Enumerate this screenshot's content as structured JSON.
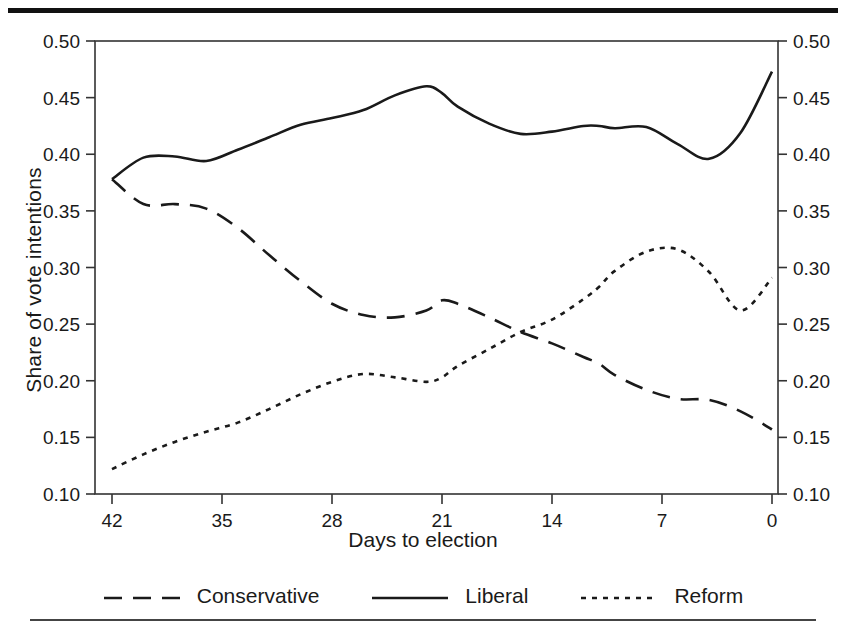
{
  "figure": {
    "ylabel": "Share of vote intentions",
    "xlabel": "Days to election",
    "y_ticks": [
      "0.50",
      "0.45",
      "0.40",
      "0.35",
      "0.30",
      "0.25",
      "0.20",
      "0.15",
      "0.10"
    ],
    "x_ticks": [
      "42",
      "35",
      "28",
      "21",
      "14",
      "7",
      "0"
    ],
    "legend": [
      {
        "name": "legend-conservative",
        "label": "Conservative",
        "dash": "18,11",
        "width": 2.6
      },
      {
        "name": "legend-liberal",
        "label": "Liberal",
        "dash": "0",
        "width": 2.6
      },
      {
        "name": "legend-reform",
        "label": "Reform",
        "dash": "5,6",
        "width": 2.6
      }
    ],
    "colors": {
      "ink": "#1a1a1a",
      "frame": "#333333",
      "background": "#ffffff"
    }
  },
  "chart_data": {
    "type": "line",
    "title": "",
    "xlabel": "Days to election",
    "ylabel": "Share of vote intentions",
    "xlim": [
      42,
      0
    ],
    "ylim": [
      0.1,
      0.5
    ],
    "x_reversed": true,
    "grid": false,
    "legend_position": "below",
    "xticks": [
      42,
      35,
      28,
      21,
      14,
      7,
      0
    ],
    "yticks": [
      0.1,
      0.15,
      0.2,
      0.25,
      0.3,
      0.35,
      0.4,
      0.45,
      0.5
    ],
    "x": [
      42,
      40,
      38,
      36,
      34,
      32,
      30,
      28,
      26,
      24,
      22,
      21,
      20,
      18,
      16,
      14,
      12,
      11,
      10,
      8,
      6,
      4,
      2,
      0
    ],
    "series": [
      {
        "name": "Conservative",
        "style": "dashed",
        "values": [
          0.378,
          0.356,
          0.356,
          0.352,
          0.335,
          0.311,
          0.288,
          0.268,
          0.258,
          0.256,
          0.262,
          0.271,
          0.268,
          0.256,
          0.243,
          0.233,
          0.221,
          0.215,
          0.205,
          0.192,
          0.184,
          0.183,
          0.173,
          0.157
        ]
      },
      {
        "name": "Liberal",
        "style": "solid",
        "values": [
          0.378,
          0.397,
          0.398,
          0.394,
          0.404,
          0.415,
          0.426,
          0.432,
          0.439,
          0.452,
          0.46,
          0.454,
          0.442,
          0.427,
          0.418,
          0.42,
          0.425,
          0.425,
          0.423,
          0.424,
          0.409,
          0.396,
          0.419,
          0.473
        ]
      },
      {
        "name": "Reform",
        "style": "dotted",
        "values": [
          0.122,
          0.135,
          0.146,
          0.155,
          0.163,
          0.175,
          0.188,
          0.199,
          0.206,
          0.203,
          0.199,
          0.203,
          0.213,
          0.228,
          0.243,
          0.254,
          0.272,
          0.283,
          0.297,
          0.314,
          0.316,
          0.296,
          0.262,
          0.291
        ]
      }
    ],
    "annotations": [
      {
        "text": "Liberal peak mid-campaign",
        "x": 22,
        "y": 0.46
      },
      {
        "text": "Reform peak",
        "x": 6,
        "y": 0.316
      },
      {
        "text": "Reform overtakes Conservative",
        "x": 17,
        "y": 0.247
      }
    ]
  }
}
